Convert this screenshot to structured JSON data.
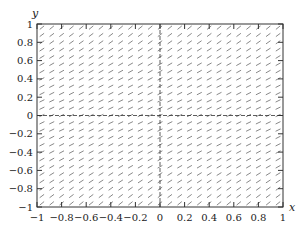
{
  "chart_data": {
    "type": "slope_field",
    "title": "",
    "xlabel": "x",
    "ylabel": "y",
    "xlim": [
      -1,
      1
    ],
    "ylim": [
      -1,
      1
    ],
    "xticks": [
      -1,
      -0.8,
      -0.6,
      -0.4,
      -0.2,
      0,
      0.2,
      0.4,
      0.6,
      0.8,
      1
    ],
    "yticks": [
      -1,
      -0.8,
      -0.6,
      -0.4,
      -0.2,
      0,
      0.2,
      0.4,
      0.6,
      0.8,
      1
    ],
    "xtick_labels": [
      "−1",
      "−0.8",
      "−0.6",
      "−0.4",
      "−0.2",
      "0",
      "0.2",
      "0.4",
      "0.6",
      "0.8",
      "1"
    ],
    "ytick_labels": [
      "−1",
      "−0.8",
      "−0.6",
      "−0.4",
      "−0.2",
      "0",
      "0.2",
      "0.4",
      "0.6",
      "0.8",
      "1"
    ],
    "grid": false,
    "field": {
      "description": "Short line segments with positive slope across the plane; flattest near y = 0",
      "nx": 25,
      "ny": 25,
      "segment_color": "#555555"
    },
    "reference_lines": [
      {
        "orientation": "horizontal",
        "value": 0,
        "style": "dashed"
      },
      {
        "orientation": "vertical",
        "value": 0,
        "style": "dashed"
      }
    ]
  },
  "colors": {
    "axis": "#333333",
    "segments": "#555555",
    "background": "#ffffff"
  }
}
